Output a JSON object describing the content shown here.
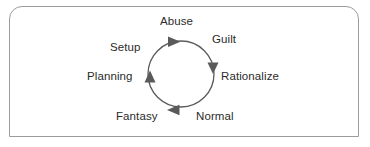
{
  "figure": {
    "border_color": "#9b9b9b",
    "background_color": "#ffffff"
  },
  "diagram": {
    "type": "cycle",
    "direction": "clockwise",
    "stroke_color": "#5a5a5a",
    "text_color": "#2b2b2b",
    "circle": {
      "center_x": 181,
      "center_y": 74,
      "radius": 33
    },
    "stages": [
      {
        "id": "abuse",
        "label": "Abuse",
        "position": "top"
      },
      {
        "id": "guilt",
        "label": "Guilt",
        "position": "top-right"
      },
      {
        "id": "rationalize",
        "label": "Rationalize",
        "position": "right"
      },
      {
        "id": "normal",
        "label": "Normal",
        "position": "bottom-right"
      },
      {
        "id": "fantasy",
        "label": "Fantasy",
        "position": "bottom-left"
      },
      {
        "id": "planning",
        "label": "Planning",
        "position": "left"
      },
      {
        "id": "setup",
        "label": "Setup",
        "position": "top-left"
      }
    ],
    "arrowheads": [
      {
        "id": "arrow-top",
        "at": "top",
        "points": "right"
      },
      {
        "id": "arrow-right",
        "at": "right",
        "points": "down"
      },
      {
        "id": "arrow-bottom",
        "at": "bottom",
        "points": "left"
      },
      {
        "id": "arrow-left",
        "at": "left",
        "points": "up"
      }
    ]
  }
}
